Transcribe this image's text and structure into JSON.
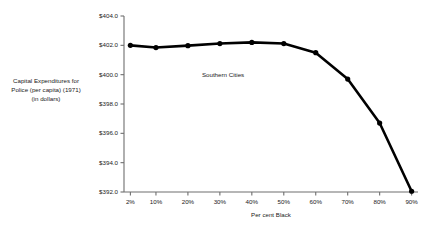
{
  "chart_data": {
    "type": "line",
    "title": "",
    "xlabel": "Per cent Black",
    "ylabel_lines": [
      "Capital Expenditures for",
      "Police (per capita) (1971)",
      "(in dollars)"
    ],
    "annotations": [
      {
        "text": "Southern Cities",
        "x": 25,
        "y": 400.0
      }
    ],
    "grid": false,
    "legend": "none",
    "xlim": [
      0,
      92
    ],
    "ylim": [
      392.0,
      404.0
    ],
    "xtick_labels": [
      "2%",
      "10%",
      "20%",
      "30%",
      "40%",
      "50%",
      "60%",
      "70%",
      "80%",
      "90%"
    ],
    "xtick_values": [
      2,
      10,
      20,
      30,
      40,
      50,
      60,
      70,
      80,
      90
    ],
    "ytick_labels": [
      "$404.0",
      "$402.0",
      "$400.0",
      "$398.0",
      "$396.0",
      "$394.0",
      "$392.0"
    ],
    "ytick_values": [
      404.0,
      402.0,
      400.0,
      398.0,
      396.0,
      394.0,
      392.0
    ],
    "series": [
      {
        "name": "Southern Cities",
        "marker": "filled-circle",
        "color": "#000000",
        "x": [
          2,
          10,
          20,
          30,
          40,
          50,
          60,
          70,
          80,
          90
        ],
        "values": [
          402.0,
          401.85,
          401.98,
          402.12,
          402.2,
          402.12,
          401.5,
          399.7,
          396.7,
          392.05
        ]
      }
    ]
  },
  "style": {
    "line_color": "#000000",
    "axis_color": "#6e6e6e",
    "text_color": "#1a1a1a",
    "background": "#ffffff"
  }
}
